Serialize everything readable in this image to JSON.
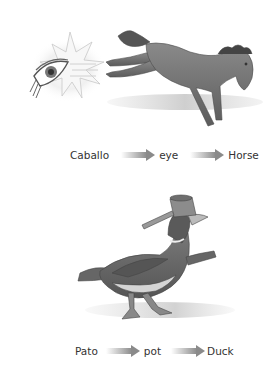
{
  "figures": [
    {
      "id": "horse",
      "illustration": "eye-kicked-by-horse",
      "chain": [
        "Caballo",
        "eye",
        "Horse"
      ]
    },
    {
      "id": "duck",
      "illustration": "duck-wearing-pot",
      "chain": [
        "Pato",
        "pot",
        "Duck"
      ]
    }
  ],
  "colors": {
    "text": "#333333",
    "arrow": "#8a8a8a",
    "illustration": "#6b6b6b",
    "background": "#ffffff"
  }
}
